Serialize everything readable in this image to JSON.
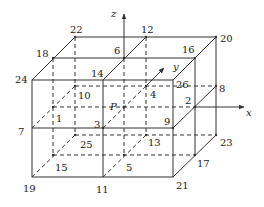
{
  "diagram": {
    "title": "",
    "axes": {
      "x": {
        "label": "x"
      },
      "y": {
        "label": "y"
      },
      "z": {
        "label": "z"
      }
    },
    "center_point": {
      "label": "P"
    },
    "points": {
      "p1": "1",
      "p2": "2",
      "p3": "3",
      "p4": "4",
      "p5": "5",
      "p6": "6",
      "p7": "7",
      "p8": "8",
      "p9": "9",
      "p10": "10",
      "p11": "11",
      "p12": "12",
      "p13": "13",
      "p14": "14",
      "p15": "15",
      "p16": "16",
      "p17": "17",
      "p18": "18",
      "p19": "19",
      "p20": "20",
      "p21": "21",
      "p22": "22",
      "p23": "23",
      "p24": "24",
      "p25": "25",
      "p26": "26"
    },
    "colors": {
      "line": "#333333",
      "text": "#222222",
      "background": "#ffffff"
    }
  }
}
